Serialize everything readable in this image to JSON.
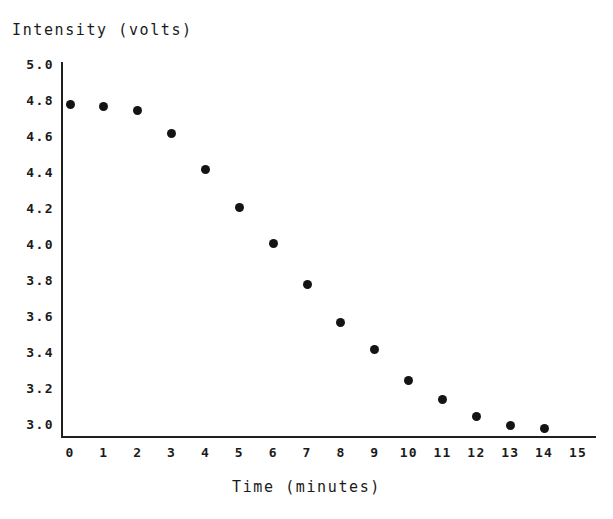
{
  "chart_data": {
    "type": "scatter",
    "title": "",
    "xlabel": "Time (minutes)",
    "ylabel": "Intensity (volts)",
    "xlim": [
      0,
      15
    ],
    "ylim": [
      3.0,
      5.0
    ],
    "grid": false,
    "legend": null,
    "x_ticks": [
      0,
      1,
      2,
      3,
      4,
      5,
      6,
      7,
      8,
      9,
      10,
      11,
      12,
      13,
      14,
      15
    ],
    "x_tick_labels": [
      "0",
      "1",
      "2",
      "3",
      "4",
      "5",
      "6",
      "7",
      "8",
      "9",
      "10",
      "11",
      "12",
      "13",
      "14",
      "15"
    ],
    "y_ticks": [
      3.0,
      3.2,
      3.4,
      3.6,
      3.8,
      4.0,
      4.2,
      4.4,
      4.6,
      4.8,
      5.0
    ],
    "y_tick_labels": [
      "3.0",
      "3.2",
      "3.4",
      "3.6",
      "3.8",
      "4.0",
      "4.2",
      "4.4",
      "4.6",
      "4.8",
      "5.0"
    ],
    "marker": "filled-circle",
    "marker_color": "#141414",
    "x": [
      0,
      1,
      2,
      3,
      4,
      5,
      6,
      7,
      8,
      9,
      10,
      11,
      12,
      13,
      14
    ],
    "values": [
      4.78,
      4.77,
      4.75,
      4.62,
      4.42,
      4.21,
      4.01,
      3.78,
      3.57,
      3.42,
      3.25,
      3.14,
      3.05,
      3.0,
      2.98
    ],
    "points": [
      {
        "x": 0,
        "y": 4.78
      },
      {
        "x": 1,
        "y": 4.77
      },
      {
        "x": 2,
        "y": 4.75
      },
      {
        "x": 3,
        "y": 4.62
      },
      {
        "x": 4,
        "y": 4.42
      },
      {
        "x": 5,
        "y": 4.21
      },
      {
        "x": 6,
        "y": 4.01
      },
      {
        "x": 7,
        "y": 3.78
      },
      {
        "x": 8,
        "y": 3.57
      },
      {
        "x": 9,
        "y": 3.42
      },
      {
        "x": 10,
        "y": 3.25
      },
      {
        "x": 11,
        "y": 3.14
      },
      {
        "x": 12,
        "y": 3.05
      },
      {
        "x": 13,
        "y": 3.0
      },
      {
        "x": 14,
        "y": 2.98
      }
    ]
  },
  "axis_colors": {
    "axis_line": "#202020",
    "marker": "#141414",
    "text": "#1a1a1a",
    "background": "#ffffff"
  }
}
